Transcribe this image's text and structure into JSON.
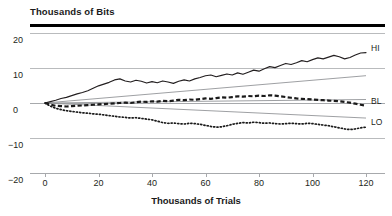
{
  "chart_data": {
    "type": "line",
    "title": "",
    "ylabel": "Thousands of Bits",
    "xlabel": "Thousands of Trials",
    "xlim": [
      -20,
      125
    ],
    "ylim": [
      -20,
      22
    ],
    "xticks": [
      -20,
      0,
      20,
      40,
      60,
      80,
      100,
      120
    ],
    "xtick_labels": [
      "−20",
      "0",
      "20",
      "40",
      "60",
      "80",
      "100",
      "120"
    ],
    "yticks": [
      20,
      10,
      0,
      -10,
      -20
    ],
    "ytick_labels": [
      "20",
      "10",
      "0",
      "−10",
      "−20"
    ],
    "grid": "horizontal",
    "legend": "inline-right",
    "series": [
      {
        "name": "HI",
        "style": "solid",
        "label": "HI",
        "x": [
          0,
          2,
          4,
          6,
          8,
          10,
          12,
          14,
          16,
          18,
          20,
          22,
          24,
          26,
          28,
          30,
          32,
          34,
          36,
          38,
          40,
          42,
          44,
          46,
          48,
          50,
          52,
          54,
          56,
          58,
          60,
          62,
          64,
          66,
          68,
          70,
          72,
          74,
          76,
          78,
          80,
          82,
          84,
          86,
          88,
          90,
          92,
          94,
          96,
          98,
          100,
          102,
          104,
          106,
          108,
          110,
          112,
          114,
          116,
          118,
          120
        ],
        "y": [
          0.0,
          0.4,
          0.8,
          1.3,
          1.6,
          2.1,
          2.6,
          3.0,
          3.5,
          4.2,
          4.9,
          5.4,
          5.9,
          6.6,
          6.9,
          6.3,
          6.0,
          6.5,
          6.2,
          5.7,
          6.1,
          5.8,
          6.3,
          6.0,
          5.6,
          6.2,
          6.6,
          6.3,
          6.9,
          7.3,
          7.8,
          8.0,
          7.5,
          7.9,
          8.3,
          8.0,
          8.6,
          8.2,
          8.8,
          9.4,
          9.1,
          9.8,
          10.4,
          10.1,
          10.7,
          11.3,
          11.0,
          11.5,
          12.1,
          11.8,
          12.4,
          12.9,
          12.6,
          13.1,
          13.6,
          13.2,
          12.6,
          13.0,
          13.7,
          14.3,
          14.4
        ]
      },
      {
        "name": "BL",
        "style": "dashed",
        "label": "BL",
        "x": [
          0,
          2,
          4,
          6,
          8,
          10,
          12,
          14,
          16,
          18,
          20,
          22,
          24,
          26,
          28,
          30,
          32,
          34,
          36,
          38,
          40,
          42,
          44,
          46,
          48,
          50,
          52,
          54,
          56,
          58,
          60,
          62,
          64,
          66,
          68,
          70,
          72,
          74,
          76,
          78,
          80,
          82,
          84,
          86,
          88,
          90,
          92,
          94,
          96,
          98,
          100,
          102,
          104,
          106,
          108,
          110,
          112,
          114,
          116,
          118,
          120
        ],
        "y": [
          0.0,
          -0.5,
          -0.8,
          -0.9,
          -1.0,
          -0.9,
          -0.8,
          -0.7,
          -0.6,
          -0.5,
          -0.4,
          -0.3,
          -0.2,
          -0.1,
          0.0,
          0.1,
          0.0,
          0.2,
          0.4,
          0.3,
          0.5,
          0.4,
          0.6,
          0.5,
          0.7,
          0.9,
          0.8,
          1.0,
          0.9,
          1.1,
          1.3,
          1.2,
          1.4,
          1.6,
          1.5,
          1.7,
          1.9,
          1.8,
          2.0,
          1.9,
          2.1,
          2.0,
          2.2,
          2.1,
          1.9,
          1.7,
          1.5,
          1.3,
          1.2,
          1.1,
          1.0,
          0.9,
          0.8,
          0.7,
          0.6,
          0.5,
          0.3,
          0.1,
          -0.2,
          -0.5,
          -0.8
        ]
      },
      {
        "name": "LO",
        "style": "dotted",
        "label": "LO",
        "x": [
          0,
          2,
          4,
          6,
          8,
          10,
          12,
          14,
          16,
          18,
          20,
          22,
          24,
          26,
          28,
          30,
          32,
          34,
          36,
          38,
          40,
          42,
          44,
          46,
          48,
          50,
          52,
          54,
          56,
          58,
          60,
          62,
          64,
          66,
          68,
          70,
          72,
          74,
          76,
          78,
          80,
          82,
          84,
          86,
          88,
          90,
          92,
          94,
          96,
          98,
          100,
          102,
          104,
          106,
          108,
          110,
          112,
          114,
          116,
          118,
          120
        ],
        "y": [
          0.0,
          -0.9,
          -1.5,
          -1.9,
          -2.2,
          -2.4,
          -2.6,
          -2.8,
          -2.9,
          -3.1,
          -3.2,
          -3.4,
          -3.6,
          -3.8,
          -4.0,
          -4.1,
          -4.3,
          -4.2,
          -4.4,
          -4.6,
          -4.8,
          -5.2,
          -5.6,
          -5.8,
          -5.7,
          -5.9,
          -6.0,
          -5.8,
          -5.9,
          -6.1,
          -6.4,
          -6.7,
          -6.9,
          -6.8,
          -6.5,
          -6.1,
          -5.8,
          -5.6,
          -5.7,
          -5.5,
          -5.6,
          -5.8,
          -5.7,
          -5.9,
          -6.0,
          -5.9,
          -5.8,
          -5.9,
          -6.0,
          -5.8,
          -5.9,
          -6.1,
          -6.3,
          -6.5,
          -6.8,
          -7.1,
          -7.4,
          -7.6,
          -7.4,
          -7.1,
          -6.9
        ]
      }
    ],
    "reference_lines": [
      {
        "name": "upper-ref",
        "x0": 0,
        "y0": 0,
        "x1": 120,
        "y1": 7.8
      },
      {
        "name": "middle-ref",
        "x0": 0,
        "y0": 0,
        "x1": 120,
        "y1": 1.0
      },
      {
        "name": "lower-ref",
        "x0": 0,
        "y0": 0,
        "x1": 120,
        "y1": -4.3
      }
    ]
  }
}
